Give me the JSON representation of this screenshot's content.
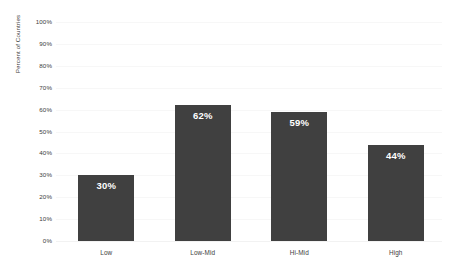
{
  "chart_data": {
    "type": "bar",
    "title": "",
    "subtitle": "",
    "xlabel": "",
    "ylabel": "Percent of Countries",
    "categories": [
      "Low",
      "Low-Mid",
      "Hi-Mid",
      "High"
    ],
    "values": [
      30,
      62,
      59,
      44
    ],
    "value_labels": [
      "30%",
      "62%",
      "59%",
      "44%"
    ],
    "ylim": [
      0,
      100
    ],
    "y_ticks": [
      0,
      10,
      20,
      30,
      40,
      50,
      60,
      70,
      80,
      90,
      100
    ],
    "y_tick_labels": [
      "0%",
      "10%",
      "20%",
      "30%",
      "40%",
      "50%",
      "60%",
      "70%",
      "80%",
      "90%",
      "100%"
    ],
    "grid": true,
    "grid_axis": "y",
    "legend": false,
    "legend_position": "none",
    "bar_color": "#404040",
    "value_label_color": "#ffffff",
    "grid_color": "#f7f7f7",
    "axis_text_color": "#3c3c3c",
    "background_color": "#ffffff"
  }
}
